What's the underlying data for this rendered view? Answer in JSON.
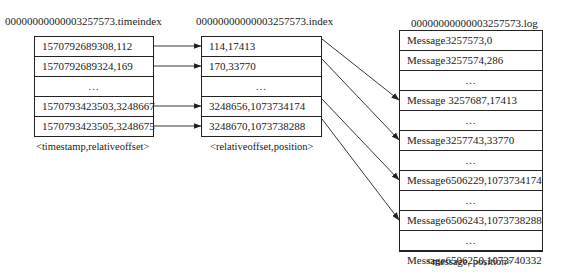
{
  "timeindex": {
    "title": "00000000000003257573.timeindex",
    "caption": "<timestamp,relativeoffset>",
    "rows": [
      "1570792689308,112",
      "1570792689324,169",
      "…",
      "1570793423503,3248667",
      "1570793423505,3248675"
    ]
  },
  "index": {
    "title": "00000000000003257573.index",
    "caption": "<relativeoffset,position>",
    "rows": [
      "114,17413",
      "170,33770",
      "…",
      "3248656,1073734174",
      "3248670,1073738288"
    ]
  },
  "log": {
    "title": "00000000000003257573.log",
    "caption": "<message, position>",
    "rows": [
      "Message3257573,0",
      "Message3257574,286",
      "…",
      "Message 3257687,17413",
      "…",
      "Message3257743,33770",
      "…",
      "Message6506229,1073734174",
      "…",
      "Message6506243,1073738288",
      "…",
      "Message6506250,1073740332"
    ]
  },
  "links": {
    "timeindex_to_index": [
      [
        0,
        0
      ],
      [
        1,
        1
      ],
      [
        3,
        3
      ],
      [
        4,
        4
      ]
    ],
    "index_to_log": [
      [
        0,
        3
      ],
      [
        1,
        5
      ],
      [
        3,
        7
      ],
      [
        4,
        9
      ]
    ]
  }
}
